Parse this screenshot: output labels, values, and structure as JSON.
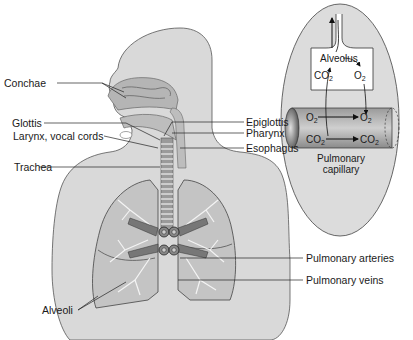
{
  "figure": {
    "labels_left": [
      {
        "id": "conchae",
        "text": "Conchae"
      },
      {
        "id": "glottis",
        "text": "Glottis"
      },
      {
        "id": "larynx",
        "text": "Larynx, vocal cords"
      },
      {
        "id": "trachea",
        "text": "Trachea"
      },
      {
        "id": "alveoli",
        "text": "Alveoli"
      }
    ],
    "labels_right": [
      {
        "id": "epiglottis",
        "text": "Epiglottis"
      },
      {
        "id": "pharynx",
        "text": "Pharynx"
      },
      {
        "id": "esophagus",
        "text": "Esophagus"
      },
      {
        "id": "pulmonary_arteries",
        "text": "Pulmonary arteries"
      },
      {
        "id": "pulmonary_veins",
        "text": "Pulmonary veins"
      }
    ],
    "inset": {
      "alveolus_label": "Alveolus",
      "co2_alveolus": "CO",
      "o2_alveolus": "O",
      "o2_capillary_left": "O",
      "o2_capillary_right": "O",
      "co2_capillary_left": "CO",
      "co2_capillary_right": "CO",
      "subscript": "2",
      "capillary_label_line1": "Pulmonary",
      "capillary_label_line2": "capillary"
    },
    "colors": {
      "body_fill": "#d9d9d9",
      "body_stroke": "#555555",
      "airway_fill": "#b0b0b0",
      "lung_fill": "#c4c4c4",
      "vessel_fill": "#7a7a7a",
      "inset_fill": "#dcdcdc",
      "line": "#222222"
    }
  }
}
